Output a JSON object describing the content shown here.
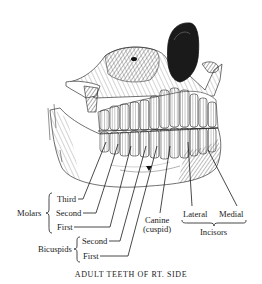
{
  "figure": {
    "caption": "ADULT TEETH OF RT. SIDE",
    "ink_color": "#1a1a1a",
    "background": "#ffffff"
  },
  "labels": {
    "molars": {
      "group": "Molars",
      "items": [
        "Third",
        "Second",
        "First"
      ]
    },
    "bicuspids": {
      "group": "Bicuspids",
      "items": [
        "Second",
        "First"
      ]
    },
    "canine": {
      "name": "Canine",
      "alt": "(cuspid)"
    },
    "incisors": {
      "group": "Incisors",
      "items": [
        "Lateral",
        "Medial"
      ]
    }
  }
}
